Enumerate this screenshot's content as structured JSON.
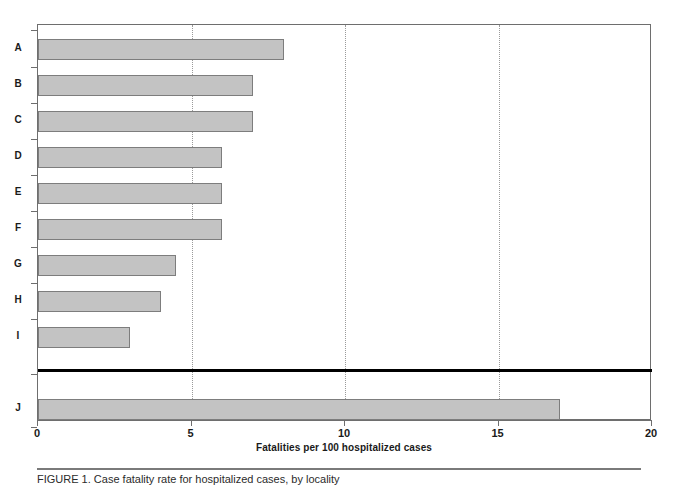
{
  "chart_data": {
    "type": "bar",
    "orientation": "horizontal",
    "title": "",
    "xlabel": "Fatalities per 100 hospitalized cases",
    "ylabel": "",
    "categories": [
      "A",
      "B",
      "C",
      "D",
      "E",
      "F",
      "G",
      "H",
      "I",
      "J"
    ],
    "values": [
      8,
      7,
      7,
      6,
      6,
      6,
      4.5,
      4,
      3,
      17
    ],
    "xlim": [
      0,
      20
    ],
    "xticks": [
      0,
      5,
      10,
      15,
      20
    ],
    "xtick_labels": [
      "0",
      "5",
      "10",
      "15",
      "20"
    ],
    "gridlines": [
      5,
      10,
      15
    ],
    "grid": true,
    "grid_style": "dotted",
    "legend": null,
    "annotations": [
      {
        "type": "separator-line",
        "between": [
          "I",
          "J"
        ],
        "style": "thick-solid-black",
        "note": "heavy rule separating categories A-I from category J"
      }
    ],
    "series": [
      {
        "name": "Fatalities per 100 hospitalized cases",
        "values": [
          8,
          7,
          7,
          6,
          6,
          6,
          4.5,
          4,
          3,
          17
        ]
      }
    ]
  },
  "caption": {
    "text": "FIGURE 1.  Case fatality rate for hospitalized cases, by locality",
    "clipped": true
  },
  "colors": {
    "bar_fill": "#c3c3c3",
    "bar_border": "#7d7d7d",
    "axis": "#6e6e6e",
    "grid": "#9a9a9a",
    "separator": "#000000",
    "text": "#1a1a1a"
  }
}
